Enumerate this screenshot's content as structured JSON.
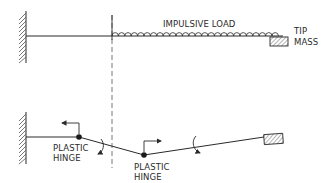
{
  "diagram": {
    "top": {
      "load_label": "IMPULSIVE LOAD",
      "tip_label_line1": "TIP",
      "tip_label_line2": "MASS"
    },
    "bottom": {
      "hinge1_line1": "PLASTIC",
      "hinge1_line2": "HINGE",
      "hinge2_line1": "PLASTIC",
      "hinge2_line2": "HINGE"
    },
    "colors": {
      "ink": "#2a2a2a",
      "background": "#ffffff"
    }
  }
}
